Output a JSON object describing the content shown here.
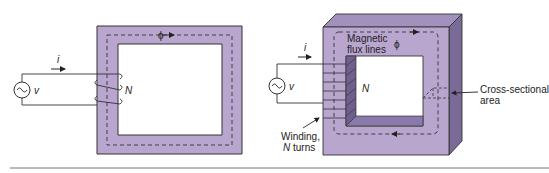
{
  "colors": {
    "core_front": "#b9a6cf",
    "core_top": "#a391bd",
    "core_side": "#7a6a98",
    "core_inner_shade": "#6e5f8c",
    "outline": "#333333",
    "rule": "#777777"
  },
  "left_figure": {
    "source_symbol": "~",
    "voltage_label": "v",
    "current_label": "i",
    "turns_label": "N",
    "flux_label": "ϕ"
  },
  "right_figure": {
    "source_symbol": "~",
    "voltage_label": "v",
    "current_label": "i",
    "turns_label": "N",
    "flux_label": "ϕ",
    "flux_lines_label_1": "Magnetic",
    "flux_lines_label_2": "flux lines",
    "cross_section_label_1": "Cross-sectional",
    "cross_section_label_2": "area",
    "winding_label_1": "Winding,",
    "winding_label_2_italic": "N",
    "winding_label_2_rest": " turns"
  }
}
